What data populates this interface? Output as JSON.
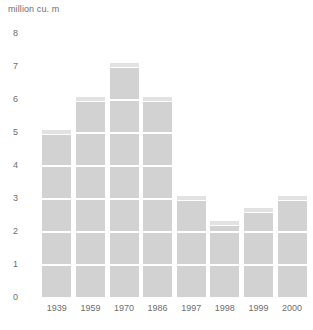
{
  "chart_data": {
    "type": "bar",
    "title": "million cu. m",
    "xlabel": "",
    "ylabel": "million cu. m",
    "categories": [
      "1939",
      "1959",
      "1970",
      "1986",
      "1997",
      "1998",
      "1999",
      "2000"
    ],
    "values": [
      5.05,
      6.05,
      7.1,
      6.05,
      3.05,
      2.3,
      2.7,
      3.05
    ],
    "ylim": [
      0,
      8
    ],
    "yticks": [
      "0",
      "1",
      "2",
      "3",
      "4",
      "5",
      "6",
      "7",
      "8"
    ],
    "ytick_values": [
      0,
      1,
      2,
      3,
      4,
      5,
      6,
      7,
      8
    ],
    "grid": "horizontal-white-stripes-inside-bars",
    "legend": "none",
    "bar_color": "#d2d2d2",
    "bar_cap_color": "#e2e2e2",
    "gridline_color": "#ffffff",
    "text_color": "#6e6e6e",
    "background": "#ffffff",
    "series": [
      {
        "name": "million cu. m",
        "values": [
          5.05,
          6.05,
          7.1,
          6.05,
          3.05,
          2.3,
          2.7,
          3.05
        ]
      }
    ],
    "points": [
      {
        "category": "1939",
        "value": 5.05
      },
      {
        "category": "1959",
        "value": 6.05
      },
      {
        "category": "1970",
        "value": 7.1
      },
      {
        "category": "1986",
        "value": 6.05
      },
      {
        "category": "1997",
        "value": 3.05
      },
      {
        "category": "1998",
        "value": 2.3
      },
      {
        "category": "1999",
        "value": 2.7
      },
      {
        "category": "2000",
        "value": 3.05
      }
    ]
  }
}
